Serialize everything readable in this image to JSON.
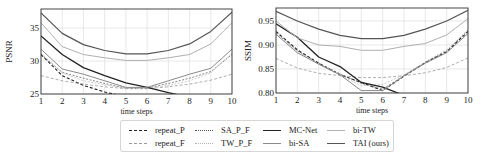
{
  "chart_data": [
    {
      "type": "line",
      "title": "",
      "xlabel": "time steps",
      "ylabel": "PSNR",
      "x": [
        1,
        2,
        3,
        4,
        5,
        6,
        7,
        8,
        9,
        10
      ],
      "xticks": [
        "1",
        "2",
        "3",
        "4",
        "5",
        "6",
        "7",
        "8",
        "9",
        "10"
      ],
      "yticks": [
        25,
        30,
        35
      ],
      "ylim": [
        25,
        37.9
      ],
      "grid": true,
      "series": [
        {
          "name": "repeat_P",
          "values": [
            31.0,
            27.8,
            26.3,
            25.3,
            24.6,
            24.0,
            23.4,
            22.9,
            22.4,
            22.0
          ]
        },
        {
          "name": "repeat_F",
          "values": [
            27.8,
            27.0,
            26.5,
            26.1,
            25.8,
            25.8,
            26.1,
            26.5,
            27.1,
            28.0
          ]
        },
        {
          "name": "SA_P_F",
          "values": [
            31.0,
            28.3,
            27.4,
            26.6,
            25.9,
            25.9,
            26.6,
            27.4,
            28.4,
            31.0
          ]
        },
        {
          "name": "TW_P_F",
          "values": [
            31.2,
            28.2,
            27.0,
            26.4,
            25.9,
            25.9,
            26.3,
            27.0,
            28.2,
            31.2
          ]
        },
        {
          "name": "MC-Net",
          "values": [
            33.8,
            31.0,
            29.0,
            27.8,
            26.7,
            26.0,
            25.2,
            24.5,
            23.8,
            23.2
          ]
        },
        {
          "name": "bi-SA",
          "values": [
            31.8,
            28.8,
            28.0,
            27.0,
            26.0,
            26.0,
            27.0,
            28.0,
            28.9,
            31.8
          ]
        },
        {
          "name": "bi-TW",
          "values": [
            35.8,
            32.2,
            31.0,
            30.5,
            30.1,
            30.1,
            30.5,
            31.0,
            32.6,
            35.8
          ]
        },
        {
          "name": "TAI (ours)",
          "values": [
            37.3,
            34.2,
            32.5,
            31.6,
            31.1,
            31.1,
            31.6,
            32.6,
            34.5,
            37.4
          ]
        }
      ]
    },
    {
      "type": "line",
      "title": "",
      "xlabel": "time steps",
      "ylabel": "SSIM",
      "x": [
        1,
        2,
        3,
        4,
        5,
        6,
        7,
        8,
        9,
        10
      ],
      "xticks": [
        "1",
        "2",
        "3",
        "4",
        "5",
        "6",
        "7",
        "8",
        "9",
        "10"
      ],
      "yticks": [
        0.8,
        0.85,
        0.9,
        0.95
      ],
      "ylim": [
        0.8,
        0.977
      ],
      "grid": true,
      "series": [
        {
          "name": "repeat_P",
          "values": [
            0.928,
            0.89,
            0.862,
            0.838,
            0.822,
            0.805,
            0.835,
            0.863,
            0.886,
            0.928
          ]
        },
        {
          "name": "repeat_F",
          "values": [
            0.872,
            0.852,
            0.841,
            0.836,
            0.832,
            0.832,
            0.836,
            0.842,
            0.853,
            0.873
          ]
        },
        {
          "name": "SA_P_F",
          "values": [
            0.925,
            0.888,
            0.862,
            0.84,
            0.82,
            0.808,
            0.836,
            0.864,
            0.888,
            0.93
          ]
        },
        {
          "name": "TW_P_F",
          "values": [
            0.93,
            0.886,
            0.86,
            0.838,
            0.815,
            0.818,
            0.838,
            0.865,
            0.89,
            0.932
          ]
        },
        {
          "name": "MC-Net",
          "values": [
            0.944,
            0.916,
            0.875,
            0.855,
            0.822,
            0.812,
            0.795,
            0.785,
            0.775,
            0.768
          ]
        },
        {
          "name": "bi-SA",
          "values": [
            0.922,
            0.884,
            0.86,
            0.838,
            0.805,
            0.805,
            0.836,
            0.862,
            0.884,
            0.924
          ]
        },
        {
          "name": "bi-TW",
          "values": [
            0.95,
            0.915,
            0.9,
            0.897,
            0.889,
            0.889,
            0.897,
            0.903,
            0.921,
            0.955
          ]
        },
        {
          "name": "TAI (ours)",
          "values": [
            0.97,
            0.95,
            0.933,
            0.92,
            0.913,
            0.913,
            0.92,
            0.933,
            0.95,
            0.972
          ]
        }
      ]
    }
  ],
  "styles": {
    "repeat_P": {
      "color": "#222222",
      "width": 1.1,
      "dash": "3,2"
    },
    "repeat_F": {
      "color": "#9a9a9a",
      "width": 0.8,
      "dash": "3,2"
    },
    "SA_P_F": {
      "color": "#555555",
      "width": 0.7,
      "dash": "2,1.5"
    },
    "TW_P_F": {
      "color": "#b4b4b4",
      "width": 0.7,
      "dash": "2,1.5"
    },
    "MC-Net": {
      "color": "#222222",
      "width": 1.3,
      "dash": ""
    },
    "bi-SA": {
      "color": "#8a8a8a",
      "width": 1.0,
      "dash": ""
    },
    "bi-TW": {
      "color": "#b0b0b0",
      "width": 1.0,
      "dash": ""
    },
    "TAI (ours)": {
      "color": "#555555",
      "width": 1.2,
      "dash": ""
    }
  },
  "legend": {
    "items": [
      {
        "label": "repeat_P"
      },
      {
        "label": "repeat_F"
      },
      {
        "label": "SA_P_F"
      },
      {
        "label": "TW_P_F"
      },
      {
        "label": "MC-Net"
      },
      {
        "label": "bi-SA"
      },
      {
        "label": "bi-TW"
      },
      {
        "label": "TAI (ours)"
      }
    ]
  }
}
